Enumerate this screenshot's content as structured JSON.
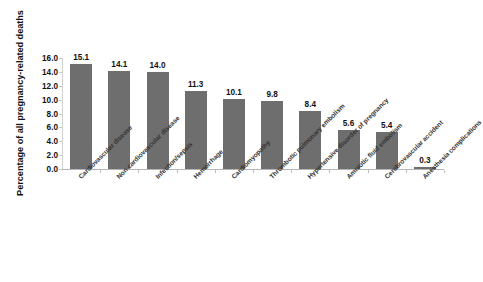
{
  "chart_data": {
    "type": "bar",
    "title": "",
    "xlabel": "",
    "ylabel": "Percentage of all pregnancy-related deaths",
    "ylim": [
      0.0,
      16.0
    ],
    "ytick_labels": [
      "16.0",
      "14.0",
      "12.0",
      "10.0",
      "8.0",
      "6.0",
      "4.0",
      "2.0",
      "0.0"
    ],
    "ytick_values": [
      16.0,
      14.0,
      12.0,
      10.0,
      8.0,
      6.0,
      4.0,
      2.0,
      0.0
    ],
    "grid": false,
    "legend": false,
    "bar_color": "#6e6e6e",
    "categories": [
      "Cardiovascular disease",
      "Non cardiovascular disease",
      "Infection/sepsis",
      "Hemorrhage",
      "Cardiomyopathy",
      "Thrombotic pulmonary embolism",
      "Hypertensive disorder of pregnancy",
      "Amniotic fluid embolism",
      "Cerebrovascular accident",
      "Anesthesia complications"
    ],
    "values": [
      15.1,
      14.1,
      14.0,
      11.3,
      10.1,
      9.8,
      8.4,
      5.6,
      5.4,
      0.3
    ],
    "value_labels": [
      "15.1",
      "14.1",
      "14.0",
      "11.3",
      "10.1",
      "9.8",
      "8.4",
      "5.6",
      "5.4",
      "0.3"
    ]
  }
}
